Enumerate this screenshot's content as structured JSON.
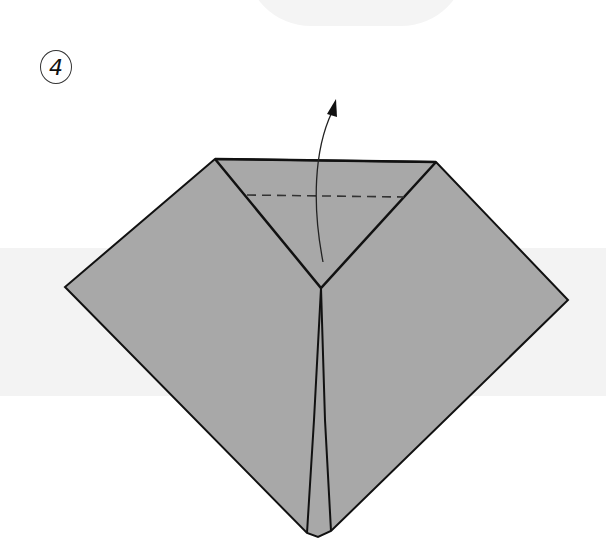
{
  "step": {
    "number": "4"
  },
  "colors": {
    "paper": "#a8a8a8",
    "line": "#111111",
    "background_band": "#f3f3f3",
    "background": "#ffffff"
  },
  "diagram": {
    "instruction": "valley-fold top triangle up along dashed line",
    "elements": [
      "paper-shape",
      "center-triangle-flap",
      "dashed-fold-line",
      "curved-fold-arrow",
      "bottom-center-flaps"
    ]
  }
}
